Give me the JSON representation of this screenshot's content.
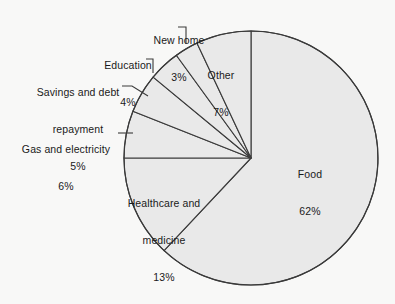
{
  "chart_data": {
    "type": "pie",
    "title": "",
    "subtitle": "",
    "xlabel": "",
    "ylabel": "",
    "legend_position": "none",
    "grid": false,
    "units": "percent",
    "start_angle_deg": 0,
    "direction": "clockwise",
    "categories": [
      "Food",
      "Healthcare and medicine",
      "Gas and electricity",
      "Savings and debt repayment",
      "Education",
      "New home",
      "Other"
    ],
    "values": [
      62,
      13,
      6,
      5,
      4,
      3,
      7
    ],
    "slices": [
      {
        "label": "Food",
        "label_line1": "Food",
        "label_line2": "",
        "value": 62,
        "pct_text": "62%",
        "placement": "inside"
      },
      {
        "label": "Healthcare and medicine",
        "label_line1": "Healthcare and",
        "label_line2": "medicine",
        "value": 13,
        "pct_text": "13%",
        "placement": "inside"
      },
      {
        "label": "Gas and electricity",
        "label_line1": "Gas and electricity",
        "label_line2": "",
        "value": 6,
        "pct_text": "6%",
        "placement": "outside-left"
      },
      {
        "label": "Savings and debt repayment",
        "label_line1": "Savings and debt",
        "label_line2": "repayment",
        "value": 5,
        "pct_text": "5%",
        "placement": "outside-left"
      },
      {
        "label": "Education",
        "label_line1": "Education",
        "label_line2": "",
        "value": 4,
        "pct_text": "4%",
        "placement": "outside-left"
      },
      {
        "label": "New home",
        "label_line1": "New home",
        "label_line2": "",
        "value": 3,
        "pct_text": "3%",
        "placement": "outside-top"
      },
      {
        "label": "Other",
        "label_line1": "Other",
        "label_line2": "",
        "value": 7,
        "pct_text": "7%",
        "placement": "inside"
      }
    ],
    "colors": {
      "slice_fill": "#e9e9e9",
      "slice_stroke": "#3a3a3a",
      "background": "#f8f8f7",
      "text": "#1a1a1a",
      "leader_line": "#3a3a3a"
    }
  }
}
